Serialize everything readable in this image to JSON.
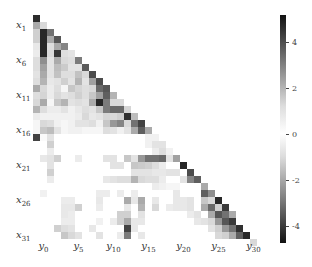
{
  "chart_data": {
    "type": "heatmap",
    "title": "",
    "xlabel": "",
    "ylabel": "",
    "n_rows": 33,
    "n_cols": 33,
    "structure": "lower-triangular",
    "row_tick_labels": [
      {
        "index": 1,
        "base": "x",
        "sub": "1"
      },
      {
        "index": 6,
        "base": "x",
        "sub": "6"
      },
      {
        "index": 11,
        "base": "x",
        "sub": "11"
      },
      {
        "index": 16,
        "base": "x",
        "sub": "16"
      },
      {
        "index": 21,
        "base": "x",
        "sub": "21"
      },
      {
        "index": 26,
        "base": "x",
        "sub": "26"
      },
      {
        "index": 31,
        "base": "x",
        "sub": "31"
      }
    ],
    "col_tick_labels": [
      {
        "index": 1,
        "base": "y",
        "sub": "0"
      },
      {
        "index": 6,
        "base": "y",
        "sub": "5"
      },
      {
        "index": 11,
        "base": "y",
        "sub": "10"
      },
      {
        "index": 16,
        "base": "y",
        "sub": "15"
      },
      {
        "index": 21,
        "base": "y",
        "sub": "20"
      },
      {
        "index": 26,
        "base": "y",
        "sub": "25"
      },
      {
        "index": 31,
        "base": "y",
        "sub": "30"
      }
    ],
    "colorbar": {
      "vmin": -4.75,
      "vmax": 5.2,
      "ticks": [
        4,
        2,
        0,
        -2,
        -4
      ],
      "tick_labels": [
        "4",
        "2",
        "0",
        "-2",
        "-4"
      ],
      "colormap": "diverging-gray (dark at both extremes, white at 0)"
    },
    "cells": [
      [
        0,
        0,
        4.5
      ],
      [
        1,
        0,
        1.8
      ],
      [
        1,
        1,
        0.8
      ],
      [
        2,
        0,
        1.0
      ],
      [
        2,
        1,
        -4.6
      ],
      [
        2,
        2,
        3.0
      ],
      [
        3,
        0,
        1.0
      ],
      [
        3,
        1,
        -4.6
      ],
      [
        3,
        2,
        1.8
      ],
      [
        3,
        3,
        3.6
      ],
      [
        4,
        0,
        0.5
      ],
      [
        4,
        1,
        -4.6
      ],
      [
        4,
        2,
        0.7
      ],
      [
        4,
        3,
        1.8
      ],
      [
        4,
        4,
        2.6
      ],
      [
        5,
        0,
        0.4
      ],
      [
        5,
        1,
        -4.6
      ],
      [
        5,
        2,
        0.8
      ],
      [
        5,
        3,
        -4.3
      ],
      [
        5,
        4,
        0.7
      ],
      [
        5,
        5,
        0.6
      ],
      [
        6,
        0,
        0.7
      ],
      [
        6,
        1,
        2.4
      ],
      [
        6,
        2,
        0.6
      ],
      [
        6,
        3,
        1.8
      ],
      [
        6,
        4,
        0.8
      ],
      [
        6,
        5,
        0.7
      ],
      [
        6,
        6,
        2.8
      ],
      [
        7,
        0,
        0.7
      ],
      [
        7,
        1,
        2.0
      ],
      [
        7,
        2,
        0.6
      ],
      [
        7,
        3,
        1.4
      ],
      [
        7,
        4,
        1.1
      ],
      [
        7,
        5,
        0.6
      ],
      [
        7,
        6,
        0.6
      ],
      [
        7,
        7,
        3.5
      ],
      [
        8,
        0,
        0.6
      ],
      [
        8,
        1,
        1.8
      ],
      [
        8,
        2,
        0.6
      ],
      [
        8,
        3,
        1.3
      ],
      [
        8,
        4,
        0.7
      ],
      [
        8,
        5,
        0.7
      ],
      [
        8,
        6,
        1.3
      ],
      [
        8,
        7,
        0.8
      ],
      [
        8,
        8,
        3.8
      ],
      [
        9,
        0,
        0.7
      ],
      [
        9,
        1,
        1.6
      ],
      [
        9,
        2,
        0.5
      ],
      [
        9,
        3,
        0.6
      ],
      [
        9,
        4,
        1.0
      ],
      [
        9,
        5,
        0.6
      ],
      [
        9,
        6,
        1.6
      ],
      [
        9,
        7,
        0.6
      ],
      [
        9,
        8,
        2.0
      ],
      [
        9,
        9,
        3.8
      ],
      [
        10,
        0,
        1.8
      ],
      [
        10,
        1,
        0.8
      ],
      [
        10,
        2,
        0.4
      ],
      [
        10,
        3,
        0.7
      ],
      [
        10,
        4,
        0.2
      ],
      [
        10,
        5,
        1.2
      ],
      [
        10,
        6,
        0.9
      ],
      [
        10,
        7,
        0.7
      ],
      [
        10,
        8,
        0.8
      ],
      [
        10,
        9,
        3.2
      ],
      [
        10,
        10,
        3.6
      ],
      [
        11,
        0,
        0.7
      ],
      [
        11,
        1,
        0.9
      ],
      [
        11,
        2,
        0.4
      ],
      [
        11,
        3,
        0.8
      ],
      [
        11,
        4,
        0.6
      ],
      [
        11,
        5,
        0.7
      ],
      [
        11,
        6,
        1.0
      ],
      [
        11,
        7,
        0.7
      ],
      [
        11,
        8,
        1.2
      ],
      [
        11,
        9,
        2.0
      ],
      [
        11,
        10,
        3.4
      ],
      [
        11,
        11,
        1.6
      ],
      [
        12,
        0,
        0.8
      ],
      [
        12,
        1,
        1.8
      ],
      [
        12,
        2,
        0.2
      ],
      [
        12,
        3,
        1.2
      ],
      [
        12,
        4,
        1.6
      ],
      [
        12,
        5,
        0.6
      ],
      [
        12,
        6,
        0.7
      ],
      [
        12,
        7,
        0.6
      ],
      [
        12,
        8,
        1.8
      ],
      [
        12,
        9,
        -4.6
      ],
      [
        12,
        10,
        2.8
      ],
      [
        12,
        11,
        0.8
      ],
      [
        12,
        12,
        0.8
      ],
      [
        13,
        0,
        1.6
      ],
      [
        13,
        1,
        0.7
      ],
      [
        13,
        2,
        0.4
      ],
      [
        13,
        3,
        0.4
      ],
      [
        13,
        4,
        0.6
      ],
      [
        13,
        5,
        0.3
      ],
      [
        13,
        6,
        0.5
      ],
      [
        13,
        7,
        0.7
      ],
      [
        13,
        8,
        0.6
      ],
      [
        13,
        9,
        1.2
      ],
      [
        13,
        10,
        2.8
      ],
      [
        13,
        11,
        3.2
      ],
      [
        13,
        12,
        3.2
      ],
      [
        13,
        13,
        0.9
      ],
      [
        14,
        0,
        0.4
      ],
      [
        14,
        1,
        0.3
      ],
      [
        14,
        2,
        0.3
      ],
      [
        14,
        3,
        0.3
      ],
      [
        14,
        4,
        0.3
      ],
      [
        14,
        5,
        0.3
      ],
      [
        14,
        6,
        0.4
      ],
      [
        14,
        7,
        0.8
      ],
      [
        14,
        8,
        0.5
      ],
      [
        14,
        9,
        0.6
      ],
      [
        14,
        10,
        0.9
      ],
      [
        14,
        11,
        0.8
      ],
      [
        14,
        12,
        1.0
      ],
      [
        14,
        13,
        -4.4
      ],
      [
        14,
        14,
        1.4
      ],
      [
        15,
        0,
        0.2
      ],
      [
        15,
        1,
        0.8
      ],
      [
        15,
        2,
        0.7
      ],
      [
        15,
        3,
        0.3
      ],
      [
        15,
        4,
        0.2
      ],
      [
        15,
        5,
        0.3
      ],
      [
        15,
        6,
        0.6
      ],
      [
        15,
        7,
        0.6
      ],
      [
        15,
        8,
        0.7
      ],
      [
        15,
        9,
        0.3
      ],
      [
        15,
        10,
        1.2
      ],
      [
        15,
        11,
        2.2
      ],
      [
        15,
        12,
        2.6
      ],
      [
        15,
        13,
        0.8
      ],
      [
        15,
        14,
        3.0
      ],
      [
        15,
        15,
        4.0
      ],
      [
        16,
        0,
        0.2
      ],
      [
        16,
        1,
        1.2
      ],
      [
        16,
        2,
        1.4
      ],
      [
        16,
        3,
        0.6
      ],
      [
        16,
        4,
        0.2
      ],
      [
        16,
        5,
        0.3
      ],
      [
        16,
        6,
        0.3
      ],
      [
        16,
        7,
        0.2
      ],
      [
        16,
        8,
        0.2
      ],
      [
        16,
        9,
        0.2
      ],
      [
        16,
        10,
        0.7
      ],
      [
        16,
        11,
        0.6
      ],
      [
        16,
        12,
        0.3
      ],
      [
        16,
        13,
        0.6
      ],
      [
        16,
        14,
        1.8
      ],
      [
        16,
        15,
        3.4
      ],
      [
        16,
        16,
        1.8
      ],
      [
        17,
        0,
        -4.0
      ],
      [
        17,
        1,
        0.1
      ],
      [
        17,
        2,
        0.6
      ],
      [
        17,
        16,
        0.3
      ],
      [
        17,
        17,
        0.3
      ],
      [
        18,
        2,
        1.0
      ],
      [
        18,
        16,
        0.3
      ],
      [
        18,
        17,
        0.6
      ],
      [
        18,
        18,
        0.6
      ],
      [
        19,
        2,
        0.4
      ],
      [
        19,
        17,
        0.4
      ],
      [
        19,
        18,
        0.7
      ],
      [
        19,
        19,
        0.3
      ],
      [
        20,
        1,
        0.5
      ],
      [
        20,
        2,
        0.6
      ],
      [
        20,
        3,
        1.0
      ],
      [
        20,
        6,
        0.4
      ],
      [
        20,
        10,
        0.6
      ],
      [
        20,
        11,
        0.6
      ],
      [
        20,
        13,
        1.2
      ],
      [
        20,
        14,
        0.6
      ],
      [
        20,
        15,
        2.2
      ],
      [
        20,
        16,
        3.0
      ],
      [
        20,
        17,
        3.0
      ],
      [
        20,
        18,
        3.2
      ],
      [
        20,
        19,
        0.6
      ],
      [
        20,
        20,
        2.0
      ],
      [
        21,
        2,
        0.6
      ],
      [
        21,
        11,
        0.6
      ],
      [
        21,
        12,
        0.6
      ],
      [
        21,
        14,
        1.2
      ],
      [
        21,
        15,
        1.1
      ],
      [
        21,
        16,
        1.0
      ],
      [
        21,
        17,
        0.7
      ],
      [
        21,
        18,
        0.4
      ],
      [
        21,
        21,
        4.6
      ],
      [
        22,
        2,
        1.0
      ],
      [
        22,
        14,
        0.6
      ],
      [
        22,
        15,
        0.6
      ],
      [
        22,
        16,
        0.6
      ],
      [
        22,
        17,
        0.5
      ],
      [
        22,
        18,
        0.5
      ],
      [
        22,
        19,
        0.6
      ],
      [
        22,
        20,
        0.6
      ],
      [
        22,
        22,
        3.8
      ],
      [
        23,
        2,
        0.4
      ],
      [
        23,
        10,
        0.5
      ],
      [
        23,
        11,
        0.6
      ],
      [
        23,
        12,
        0.7
      ],
      [
        23,
        13,
        0.7
      ],
      [
        23,
        14,
        1.6
      ],
      [
        23,
        15,
        0.8
      ],
      [
        23,
        16,
        0.7
      ],
      [
        23,
        17,
        0.7
      ],
      [
        23,
        18,
        0.4
      ],
      [
        23,
        21,
        0.6
      ],
      [
        23,
        22,
        2.6
      ],
      [
        23,
        23,
        3.4
      ],
      [
        24,
        17,
        0.4
      ],
      [
        24,
        18,
        0.3
      ],
      [
        24,
        19,
        0.2
      ],
      [
        24,
        20,
        0.2
      ],
      [
        24,
        24,
        1.8
      ],
      [
        25,
        1,
        0.3
      ],
      [
        25,
        9,
        0.4
      ],
      [
        25,
        10,
        0.4
      ],
      [
        25,
        12,
        0.4
      ],
      [
        25,
        14,
        0.4
      ],
      [
        25,
        20,
        0.5
      ],
      [
        25,
        24,
        3.4
      ],
      [
        25,
        25,
        2.4
      ],
      [
        26,
        4,
        0.4
      ],
      [
        26,
        5,
        0.4
      ],
      [
        26,
        9,
        0.5
      ],
      [
        26,
        13,
        1.8
      ],
      [
        26,
        14,
        0.5
      ],
      [
        26,
        15,
        1.8
      ],
      [
        26,
        17,
        0.5
      ],
      [
        26,
        20,
        0.5
      ],
      [
        26,
        21,
        0.5
      ],
      [
        26,
        22,
        0.6
      ],
      [
        26,
        24,
        1.2
      ],
      [
        26,
        25,
        0.8
      ],
      [
        26,
        26,
        4.6
      ],
      [
        27,
        4,
        0.5
      ],
      [
        27,
        5,
        0.5
      ],
      [
        27,
        6,
        1.0
      ],
      [
        27,
        9,
        0.4
      ],
      [
        27,
        13,
        0.5
      ],
      [
        27,
        15,
        1.6
      ],
      [
        27,
        17,
        0.8
      ],
      [
        27,
        19,
        0.4
      ],
      [
        27,
        20,
        0.5
      ],
      [
        27,
        21,
        0.5
      ],
      [
        27,
        22,
        0.6
      ],
      [
        27,
        24,
        1.8
      ],
      [
        27,
        25,
        3.2
      ],
      [
        27,
        26,
        1.0
      ],
      [
        27,
        27,
        4.2
      ],
      [
        28,
        4,
        0.5
      ],
      [
        28,
        5,
        0.4
      ],
      [
        28,
        12,
        1.0
      ],
      [
        28,
        13,
        1.0
      ],
      [
        28,
        15,
        0.6
      ],
      [
        28,
        22,
        0.4
      ],
      [
        28,
        23,
        0.6
      ],
      [
        28,
        25,
        1.8
      ],
      [
        28,
        26,
        3.6
      ],
      [
        28,
        27,
        3.0
      ],
      [
        28,
        28,
        1.8
      ],
      [
        29,
        4,
        0.4
      ],
      [
        29,
        5,
        0.4
      ],
      [
        29,
        9,
        0.3
      ],
      [
        29,
        11,
        0.4
      ],
      [
        29,
        12,
        1.0
      ],
      [
        29,
        13,
        1.8
      ],
      [
        29,
        14,
        0.5
      ],
      [
        29,
        15,
        0.5
      ],
      [
        29,
        23,
        0.5
      ],
      [
        29,
        24,
        0.6
      ],
      [
        29,
        25,
        0.8
      ],
      [
        29,
        26,
        2.2
      ],
      [
        29,
        27,
        3.6
      ],
      [
        29,
        28,
        4.2
      ],
      [
        30,
        3,
        1.0
      ],
      [
        30,
        4,
        0.7
      ],
      [
        30,
        5,
        0.6
      ],
      [
        30,
        8,
        0.5
      ],
      [
        30,
        13,
        -4.0
      ],
      [
        30,
        14,
        0.5
      ],
      [
        30,
        25,
        0.6
      ],
      [
        30,
        26,
        1.0
      ],
      [
        30,
        27,
        2.2
      ],
      [
        30,
        28,
        3.0
      ],
      [
        30,
        29,
        4.4
      ],
      [
        31,
        4,
        1.2
      ],
      [
        31,
        5,
        0.8
      ],
      [
        31,
        6,
        0.6
      ],
      [
        31,
        9,
        0.6
      ],
      [
        31,
        12,
        0.4
      ],
      [
        31,
        13,
        2.8
      ],
      [
        31,
        15,
        0.5
      ],
      [
        31,
        26,
        0.8
      ],
      [
        31,
        27,
        1.0
      ],
      [
        31,
        28,
        1.8
      ],
      [
        31,
        29,
        3.4
      ],
      [
        31,
        30,
        4.6
      ],
      [
        32,
        31,
        0.8
      ]
    ]
  }
}
